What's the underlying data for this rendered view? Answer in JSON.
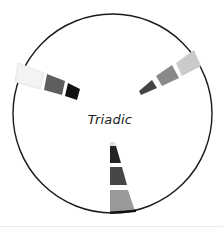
{
  "diagram": {
    "title": "Triadic",
    "circle": {
      "cx": 112.5,
      "cy": 113.5,
      "r": 99.5,
      "stroke": "#1a1a1a"
    },
    "wedges": [
      {
        "name": "upper-left",
        "segments": [
          {
            "shade": "lightest",
            "color": "#f3f3f3"
          },
          {
            "shade": "medium",
            "color": "#5e5e5e"
          },
          {
            "shade": "darkest",
            "color": "#111111"
          }
        ]
      },
      {
        "name": "upper-right",
        "segments": [
          {
            "shade": "light",
            "color": "#cacaca"
          },
          {
            "shade": "medium",
            "color": "#8a8a8a"
          },
          {
            "shade": "dark",
            "color": "#444444"
          }
        ]
      },
      {
        "name": "bottom",
        "segments": [
          {
            "shade": "mid-light",
            "color": "#9a9a9a"
          },
          {
            "shade": "dark",
            "color": "#474747"
          },
          {
            "shade": "darkest",
            "color": "#222222"
          }
        ]
      }
    ]
  }
}
